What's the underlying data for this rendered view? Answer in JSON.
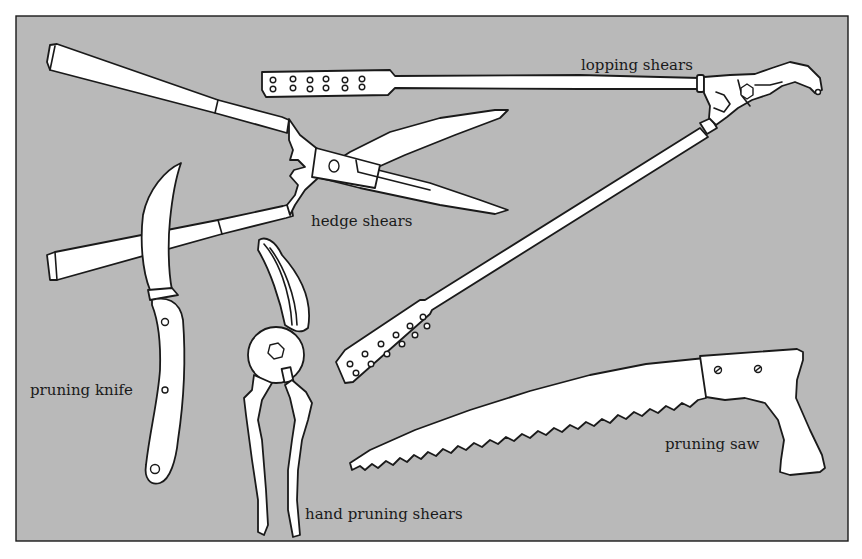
{
  "figure": {
    "background_color": "#b9b9b9",
    "line_color": "#1a1a1a",
    "tool_fill": "#ffffff"
  },
  "labels": {
    "lopping_shears": "lopping shears",
    "hedge_shears": "hedge shears",
    "pruning_knife": "pruning knife",
    "hand_pruning_shears": "hand pruning shears",
    "pruning_saw": "pruning saw"
  }
}
